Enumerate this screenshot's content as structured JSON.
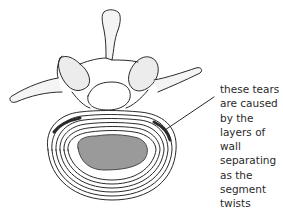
{
  "figure": {
    "annotation": {
      "lines": [
        "these tears",
        "are caused",
        "by the",
        "layers of",
        "wall",
        "separating",
        "as the",
        "segment",
        "twists"
      ]
    },
    "colors": {
      "line": "#2a2a2a",
      "shade": "#9a9a9a",
      "background": "#ffffff"
    }
  }
}
